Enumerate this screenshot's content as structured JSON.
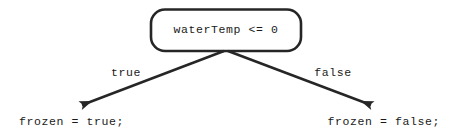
{
  "diagram": {
    "type": "flowchart-decision",
    "background_color": "#ffffff",
    "stroke_color": "#262626",
    "text_color": "#1a1a1a",
    "condition_node": {
      "shape": "rounded-rectangle",
      "text": "waterTemp <= 0"
    },
    "edges": [
      {
        "name": "true-branch",
        "label": "true",
        "direction": "down-left",
        "from": [
          226,
          51
        ],
        "to": [
          78,
          108
        ]
      },
      {
        "name": "false-branch",
        "label": "false",
        "direction": "down-right",
        "from": [
          226,
          51
        ],
        "to": [
          375,
          108
        ]
      }
    ],
    "statements": [
      {
        "name": "true-statement",
        "text": "frozen = true;"
      },
      {
        "name": "false-statement",
        "text": "frozen = false;"
      }
    ]
  }
}
